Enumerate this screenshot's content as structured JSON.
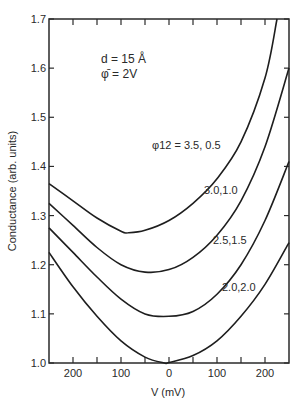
{
  "chart_data": {
    "type": "line",
    "title": "",
    "xlabel": "V (mV)",
    "ylabel": "Conductance (arb. units)",
    "xlim": [
      -250,
      250
    ],
    "ylim": [
      1.0,
      1.7
    ],
    "grid": false,
    "x_tick_labels": [
      "200",
      "100",
      "0",
      "100",
      "200"
    ],
    "x_tick_values": [
      -200,
      -100,
      0,
      100,
      200
    ],
    "x_minor_ticks": [
      -150,
      -50,
      50,
      150
    ],
    "y_tick_labels": [
      "1.0",
      "1.1",
      "1.2",
      "1.3",
      "1.4",
      "1.5",
      "1.6",
      "1.7"
    ],
    "y_tick_values": [
      1.0,
      1.1,
      1.2,
      1.3,
      1.4,
      1.5,
      1.6,
      1.7
    ],
    "annotations": {
      "line1": "d = 15 Å",
      "line2": "φ̄ = 2V"
    },
    "legend_position": "inline labels on curves",
    "series": [
      {
        "name": "φ12 = 3.5, 0.5",
        "label": "φ12 = 3.5, 0.5",
        "x": [
          -250,
          -200,
          -150,
          -100,
          -85,
          -50,
          0,
          50,
          100,
          150,
          200,
          225
        ],
        "values": [
          1.365,
          1.33,
          1.295,
          1.268,
          1.265,
          1.27,
          1.29,
          1.325,
          1.375,
          1.45,
          1.58,
          1.7
        ]
      },
      {
        "name": "3.0, 1.0",
        "label": "3.0,1.0",
        "x": [
          -250,
          -200,
          -150,
          -100,
          -50,
          0,
          50,
          100,
          150,
          200,
          250
        ],
        "values": [
          1.325,
          1.28,
          1.235,
          1.2,
          1.185,
          1.19,
          1.215,
          1.26,
          1.33,
          1.44,
          1.6
        ]
      },
      {
        "name": "2.5, 1.5",
        "label": "2.5,1.5",
        "x": [
          -250,
          -200,
          -150,
          -100,
          -50,
          0,
          50,
          100,
          150,
          200,
          250
        ],
        "values": [
          1.275,
          1.225,
          1.175,
          1.13,
          1.1,
          1.095,
          1.105,
          1.14,
          1.2,
          1.29,
          1.41
        ]
      },
      {
        "name": "2.0, 2.0",
        "label": "2.0,2.0",
        "x": [
          -250,
          -200,
          -150,
          -100,
          -50,
          -10,
          0,
          50,
          100,
          150,
          200,
          250
        ],
        "values": [
          1.225,
          1.155,
          1.095,
          1.045,
          1.012,
          1.0,
          1.001,
          1.015,
          1.045,
          1.095,
          1.16,
          1.245
        ]
      }
    ]
  }
}
